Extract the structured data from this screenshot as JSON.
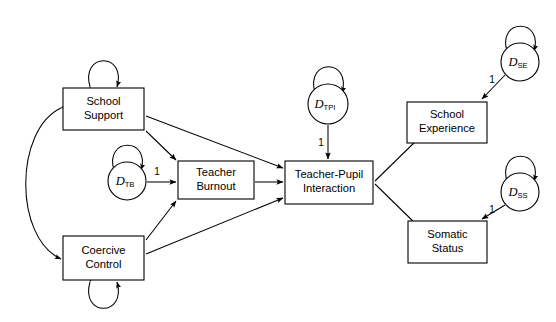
{
  "diagram": {
    "type": "path-diagram",
    "background_color": "#ffffff",
    "line_color": "#000000",
    "latent_boxes": [
      {
        "id": "school_support",
        "line1": "School",
        "line2": "Support",
        "x": 63,
        "y": 88,
        "w": 81,
        "h": 42
      },
      {
        "id": "coercive_control",
        "line1": "Coercive",
        "line2": "Control",
        "x": 63,
        "y": 236,
        "w": 81,
        "h": 44
      },
      {
        "id": "teacher_burnout",
        "line1": "Teacher",
        "line2": "Burnout",
        "x": 178,
        "y": 161,
        "w": 76,
        "h": 38
      },
      {
        "id": "teacher_pupil_interaction",
        "line1": "Teacher-Pupil",
        "line2": "Interaction",
        "x": 285,
        "y": 161,
        "w": 88,
        "h": 43
      },
      {
        "id": "school_experience",
        "line1": "School",
        "line2": "Experience",
        "x": 407,
        "y": 102,
        "w": 80,
        "h": 41
      },
      {
        "id": "somatic_status",
        "line1": "Somatic",
        "line2": "Status",
        "x": 408,
        "y": 221,
        "w": 79,
        "h": 42
      }
    ],
    "disturbance_circles": [
      {
        "id": "d_tb",
        "base": "D",
        "sub": "TB",
        "cx": 127,
        "cy": 181,
        "r": 19
      },
      {
        "id": "d_tpi",
        "base": "D",
        "sub": "TPI",
        "cx": 328,
        "cy": 104,
        "r": 20
      },
      {
        "id": "d_se",
        "base": "D",
        "sub": "SE",
        "cx": 520,
        "cy": 62,
        "r": 19
      },
      {
        "id": "d_ss",
        "base": "D",
        "sub": "SS",
        "cx": 520,
        "cy": 192,
        "r": 19
      }
    ],
    "path_labels": [
      {
        "id": "label-d-tb-to-tb",
        "text": "1",
        "x": 157,
        "y": 172
      },
      {
        "id": "label-d-tpi-to-tpi",
        "text": "1",
        "x": 321,
        "y": 143
      },
      {
        "id": "label-d-se-to-se",
        "text": "1",
        "x": 492,
        "y": 80
      },
      {
        "id": "label-d-ss-to-ss",
        "text": "1",
        "x": 492,
        "y": 210
      }
    ],
    "directed_paths": [
      {
        "id": "school-support-to-teacher-burnout",
        "from": "school_support",
        "to": "teacher_burnout"
      },
      {
        "id": "school-support-to-teacher-pupil-interaction",
        "from": "school_support",
        "to": "teacher_pupil_interaction"
      },
      {
        "id": "coercive-control-to-teacher-burnout",
        "from": "coercive_control",
        "to": "teacher_burnout"
      },
      {
        "id": "coercive-control-to-teacher-pupil-interaction",
        "from": "coercive_control",
        "to": "teacher_pupil_interaction"
      },
      {
        "id": "teacher-burnout-to-teacher-pupil-interaction",
        "from": "teacher_burnout",
        "to": "teacher_pupil_interaction"
      },
      {
        "id": "teacher-pupil-interaction-to-school-experience",
        "from": "teacher_pupil_interaction",
        "to": "school_experience"
      },
      {
        "id": "teacher-pupil-interaction-to-somatic-status",
        "from": "teacher_pupil_interaction",
        "to": "somatic_status"
      },
      {
        "id": "d-tb-to-teacher-burnout",
        "from": "d_tb",
        "to": "teacher_burnout",
        "label": "1"
      },
      {
        "id": "d-tpi-to-teacher-pupil-interaction",
        "from": "d_tpi",
        "to": "teacher_pupil_interaction",
        "label": "1"
      },
      {
        "id": "d-se-to-school-experience",
        "from": "d_se",
        "to": "school_experience",
        "label": "1"
      },
      {
        "id": "d-ss-to-somatic-status",
        "from": "d_ss",
        "to": "somatic_status",
        "label": "1"
      }
    ],
    "covariances": [
      {
        "id": "school-support-coercive-control-covariance",
        "from": "school_support",
        "to": "coercive_control",
        "style": "double-headed-curve"
      }
    ],
    "variances": [
      {
        "id": "school-support-variance-loop",
        "node": "school_support",
        "position": "top"
      },
      {
        "id": "coercive-control-variance-loop",
        "node": "coercive_control",
        "position": "bottom"
      },
      {
        "id": "d-tb-variance-loop",
        "node": "d_tb",
        "position": "top"
      },
      {
        "id": "d-tpi-variance-loop",
        "node": "d_tpi",
        "position": "top"
      },
      {
        "id": "d-se-variance-loop",
        "node": "d_se",
        "position": "top"
      },
      {
        "id": "d-ss-variance-loop",
        "node": "d_ss",
        "position": "top"
      }
    ]
  }
}
